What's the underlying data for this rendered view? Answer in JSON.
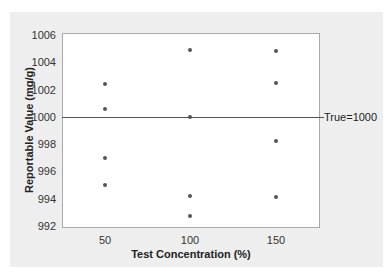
{
  "chart_data": {
    "type": "scatter",
    "title": "",
    "xlabel": "Test Concentration (%)",
    "ylabel": "Reportable Value (mg/g)",
    "ylim": [
      992,
      1006
    ],
    "xlim": [
      25,
      175
    ],
    "x_ticks": [
      "50",
      "100",
      "150"
    ],
    "y_ticks": [
      "992",
      "994",
      "996",
      "998",
      "1000",
      "1002",
      "1004",
      "1006"
    ],
    "grid": false,
    "legend": null,
    "reference_line": {
      "y": 1000,
      "label": "True=1000"
    },
    "series": [
      {
        "name": "Reportable values",
        "points": [
          {
            "x": 50,
            "y": 1002.4
          },
          {
            "x": 50,
            "y": 1000.6
          },
          {
            "x": 50,
            "y": 997.0
          },
          {
            "x": 50,
            "y": 995.0
          },
          {
            "x": 100,
            "y": 1004.9
          },
          {
            "x": 100,
            "y": 1000.0
          },
          {
            "x": 100,
            "y": 994.2
          },
          {
            "x": 100,
            "y": 992.7
          },
          {
            "x": 150,
            "y": 1004.8
          },
          {
            "x": 150,
            "y": 1002.5
          },
          {
            "x": 150,
            "y": 998.2
          },
          {
            "x": 150,
            "y": 994.1
          }
        ]
      }
    ]
  },
  "labels": {
    "xlabel": "Test Concentration (%)",
    "ylabel": "Reportable Value (mg/g)",
    "reference": "True=1000"
  },
  "colors": {
    "point": "#555555",
    "reference_line": "#555555",
    "panel_bg": "#eeeeee",
    "plot_bg": "#ffffff"
  }
}
